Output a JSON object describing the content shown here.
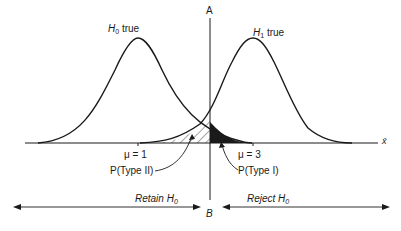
{
  "labels": {
    "h0_true": {
      "sym": "H",
      "sub": "0",
      "text": " true"
    },
    "h1_true": {
      "sym": "H",
      "sub": "1",
      "text": " true"
    },
    "line_top": "A",
    "line_bottom": "B",
    "mu1": "μ = 1",
    "mu3": "μ = 3",
    "type2": "P(Type II)",
    "type1": "P(Type I)",
    "retain": {
      "text": "Retain H",
      "sub": "0"
    },
    "reject": {
      "text": "Reject H",
      "sub": "0"
    },
    "x_axis": "x̄"
  },
  "colors": {
    "ink": "#1a1a1a",
    "background": "#ffffff"
  }
}
